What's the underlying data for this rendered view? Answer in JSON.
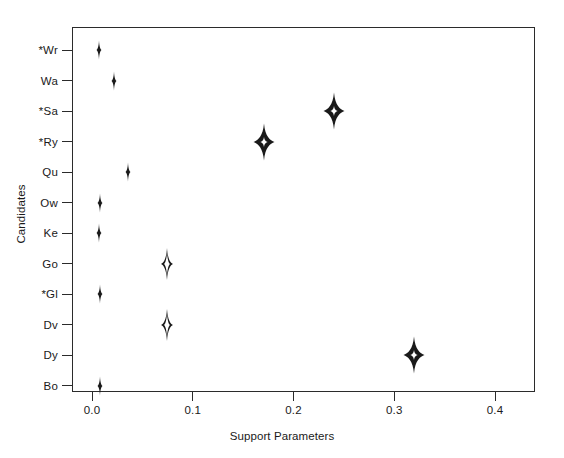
{
  "chart_data": {
    "type": "scatter",
    "title": "",
    "xlabel": "Support Parameters",
    "ylabel": "Candidates",
    "xlim": [
      0.0,
      0.4
    ],
    "xticks": [
      0.0,
      0.1,
      0.2,
      0.3,
      0.4
    ],
    "xticklabels": [
      "0.0",
      "0.1",
      "0.2",
      "0.3",
      "0.4"
    ],
    "grid": false,
    "legend": null,
    "categories": [
      "*Wr",
      "Wa",
      "*Sa",
      "*Ry",
      "Qu",
      "Ow",
      "Ke",
      "Go",
      "*Gl",
      "Dv",
      "Dy",
      "Bo"
    ],
    "values": [
      0.007,
      0.022,
      0.24,
      0.171,
      0.036,
      0.008,
      0.007,
      0.074,
      0.008,
      0.074,
      0.32,
      0.008
    ],
    "points": [
      {
        "label": "*Wr",
        "value": 0.007,
        "marker": "filled-star-diamond",
        "size": "tiny"
      },
      {
        "label": "Wa",
        "value": 0.022,
        "marker": "filled-star-diamond",
        "size": "tiny"
      },
      {
        "label": "*Sa",
        "value": 0.24,
        "marker": "filled-star-diamond",
        "size": "large"
      },
      {
        "label": "*Ry",
        "value": 0.171,
        "marker": "filled-star-diamond",
        "size": "large"
      },
      {
        "label": "Qu",
        "value": 0.036,
        "marker": "filled-star-diamond",
        "size": "tiny"
      },
      {
        "label": "Ow",
        "value": 0.008,
        "marker": "filled-star-diamond",
        "size": "tiny"
      },
      {
        "label": "Ke",
        "value": 0.007,
        "marker": "filled-star-diamond",
        "size": "tiny"
      },
      {
        "label": "Go",
        "value": 0.074,
        "marker": "open-star-diamond",
        "size": "medium"
      },
      {
        "label": "*Gl",
        "value": 0.008,
        "marker": "filled-star-diamond",
        "size": "tiny"
      },
      {
        "label": "Dv",
        "value": 0.074,
        "marker": "open-star-diamond",
        "size": "medium"
      },
      {
        "label": "Dy",
        "value": 0.32,
        "marker": "filled-star-diamond",
        "size": "large"
      },
      {
        "label": "Bo",
        "value": 0.008,
        "marker": "filled-star-diamond",
        "size": "tiny"
      }
    ],
    "colors": {
      "marker_fill": "#1a1a1a",
      "marker_hole": "#ffffff",
      "axis": "#2b2b2b",
      "background": "#ffffff"
    }
  }
}
